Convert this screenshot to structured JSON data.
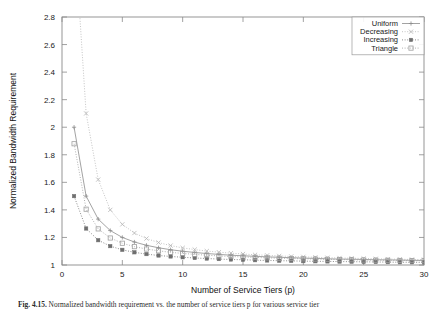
{
  "figure": {
    "caption_label": "Fig. 4.15.",
    "caption_text": "Normalized bandwidth requirement vs. the number of service tiers p for various service tier"
  },
  "axes": {
    "x_title": "Number of Service Tiers (p)",
    "y_title": "Normalized Bandwidth Requirement",
    "x_ticks": [
      "0",
      "5",
      "10",
      "15",
      "20",
      "25",
      "30"
    ],
    "y_ticks": [
      "1",
      "1.2",
      "1.4",
      "1.6",
      "1.8",
      "2",
      "2.2",
      "2.4",
      "2.6",
      "2.8"
    ]
  },
  "legend": {
    "position": "top-right",
    "entries": [
      {
        "label": "Uniform",
        "marker": "plus-marker",
        "color": "#8c8c8c",
        "dash": "none"
      },
      {
        "label": "Decreasing",
        "marker": "cross-marker",
        "color": "#b5b5b5",
        "dash": "dotted"
      },
      {
        "label": "Increasing",
        "marker": "filled-square-marker",
        "color": "#6f6f6f",
        "dash": "dotted"
      },
      {
        "label": "Triangle",
        "marker": "open-square-marker",
        "color": "#9e9e9e",
        "dash": "dotted"
      }
    ]
  },
  "chart_data": {
    "type": "line",
    "title": "",
    "xlabel": "Number of Service Tiers (p)",
    "ylabel": "Normalized Bandwidth Requirement",
    "xlim": [
      0,
      30
    ],
    "ylim": [
      1,
      2.8
    ],
    "grid": false,
    "legend_position": "top-right",
    "x": [
      1,
      2,
      3,
      4,
      5,
      6,
      7,
      8,
      9,
      10,
      11,
      12,
      13,
      14,
      15,
      16,
      17,
      18,
      19,
      20,
      21,
      22,
      23,
      24,
      25,
      26,
      27,
      28,
      29,
      30
    ],
    "series": [
      {
        "name": "Uniform",
        "marker": "plus-marker",
        "color": "#8c8c8c",
        "values": [
          2.0,
          1.5,
          1.333,
          1.25,
          1.2,
          1.167,
          1.143,
          1.125,
          1.111,
          1.1,
          1.091,
          1.083,
          1.077,
          1.071,
          1.067,
          1.063,
          1.059,
          1.056,
          1.053,
          1.05,
          1.048,
          1.045,
          1.043,
          1.042,
          1.04,
          1.038,
          1.037,
          1.036,
          1.034,
          1.033
        ]
      },
      {
        "name": "Decreasing",
        "marker": "cross-marker",
        "color": "#b5b5b5",
        "values": [
          3.45,
          2.1,
          1.62,
          1.4,
          1.295,
          1.232,
          1.192,
          1.163,
          1.141,
          1.124,
          1.112,
          1.101,
          1.093,
          1.086,
          1.08,
          1.074,
          1.07,
          1.066,
          1.062,
          1.059,
          1.056,
          1.053,
          1.051,
          1.049,
          1.047,
          1.045,
          1.043,
          1.042,
          1.04,
          1.039
        ]
      },
      {
        "name": "Increasing",
        "marker": "filled-square-marker",
        "color": "#6f6f6f",
        "values": [
          1.5,
          1.265,
          1.18,
          1.137,
          1.11,
          1.092,
          1.079,
          1.069,
          1.062,
          1.056,
          1.051,
          1.047,
          1.043,
          1.04,
          1.038,
          1.035,
          1.033,
          1.031,
          1.03,
          1.028,
          1.027,
          1.026,
          1.025,
          1.024,
          1.023,
          1.022,
          1.021,
          1.02,
          1.02,
          1.019
        ]
      },
      {
        "name": "Triangle",
        "marker": "open-square-marker",
        "color": "#9e9e9e",
        "values": [
          1.88,
          1.405,
          1.262,
          1.196,
          1.158,
          1.133,
          1.116,
          1.103,
          1.092,
          1.084,
          1.077,
          1.071,
          1.066,
          1.062,
          1.058,
          1.055,
          1.052,
          1.049,
          1.047,
          1.045,
          1.043,
          1.041,
          1.039,
          1.038,
          1.036,
          1.035,
          1.034,
          1.033,
          1.032,
          1.031
        ]
      }
    ]
  }
}
